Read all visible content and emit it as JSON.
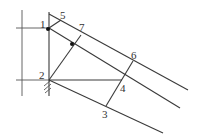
{
  "diagram": {
    "type": "geometric-construction",
    "labels": {
      "p1": "1",
      "p2": "2",
      "p3": "3",
      "p4": "4",
      "p5": "5",
      "p6": "6",
      "p7": "7"
    },
    "points": {
      "p1": [
        49,
        29
      ],
      "p2": [
        49,
        80
      ],
      "p3": [
        106,
        106
      ],
      "p4": [
        122,
        79
      ],
      "p5": [
        61,
        20
      ],
      "p6": [
        133,
        61
      ],
      "p7": [
        81,
        35
      ],
      "marker": [
        72,
        44
      ]
    },
    "colors": {
      "line": "#3a3a3a",
      "label": "#333333",
      "dot": "#111111"
    }
  }
}
